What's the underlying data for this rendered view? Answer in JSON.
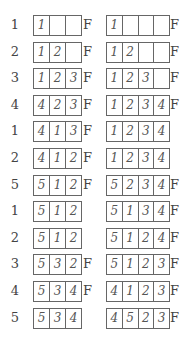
{
  "fault_marker": "F",
  "rows": [
    {
      "ref": "1",
      "left": [
        "1",
        "",
        ""
      ],
      "left_fault": "F",
      "right": [
        "1",
        "",
        "",
        ""
      ],
      "right_fault": "F"
    },
    {
      "ref": "2",
      "left": [
        "1",
        "2",
        ""
      ],
      "left_fault": "F",
      "right": [
        "1",
        "2",
        "",
        ""
      ],
      "right_fault": "F"
    },
    {
      "ref": "3",
      "left": [
        "1",
        "2",
        "3"
      ],
      "left_fault": "F",
      "right": [
        "1",
        "2",
        "3",
        ""
      ],
      "right_fault": "F"
    },
    {
      "ref": "4",
      "left": [
        "4",
        "2",
        "3"
      ],
      "left_fault": "F",
      "right": [
        "1",
        "2",
        "3",
        "4"
      ],
      "right_fault": "F"
    },
    {
      "ref": "1",
      "left": [
        "4",
        "1",
        "3"
      ],
      "left_fault": "F",
      "right": [
        "1",
        "2",
        "3",
        "4"
      ],
      "right_fault": ""
    },
    {
      "ref": "2",
      "left": [
        "4",
        "1",
        "2"
      ],
      "left_fault": "F",
      "right": [
        "1",
        "2",
        "3",
        "4"
      ],
      "right_fault": ""
    },
    {
      "ref": "5",
      "left": [
        "5",
        "1",
        "2"
      ],
      "left_fault": "F",
      "right": [
        "5",
        "2",
        "3",
        "4"
      ],
      "right_fault": "F"
    },
    {
      "ref": "1",
      "left": [
        "5",
        "1",
        "2"
      ],
      "left_fault": "",
      "right": [
        "5",
        "1",
        "3",
        "4"
      ],
      "right_fault": "F"
    },
    {
      "ref": "2",
      "left": [
        "5",
        "1",
        "2"
      ],
      "left_fault": "",
      "right": [
        "5",
        "1",
        "2",
        "4"
      ],
      "right_fault": "F"
    },
    {
      "ref": "3",
      "left": [
        "5",
        "3",
        "2"
      ],
      "left_fault": "F",
      "right": [
        "5",
        "1",
        "2",
        "3"
      ],
      "right_fault": "F"
    },
    {
      "ref": "4",
      "left": [
        "5",
        "3",
        "4"
      ],
      "left_fault": "F",
      "right": [
        "4",
        "1",
        "2",
        "3"
      ],
      "right_fault": "F"
    },
    {
      "ref": "5",
      "left": [
        "5",
        "3",
        "4"
      ],
      "left_fault": "",
      "right": [
        "4",
        "5",
        "2",
        "3"
      ],
      "right_fault": "F"
    }
  ]
}
